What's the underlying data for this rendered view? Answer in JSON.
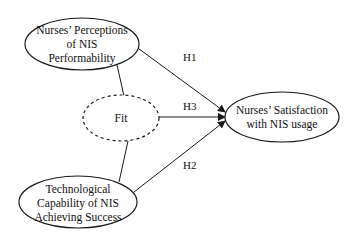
{
  "diagram": {
    "type": "research-model",
    "nodes": [
      {
        "id": "perceptions",
        "lines": [
          "Nurses’ Perceptions",
          "of NIS",
          "Performability"
        ],
        "style": "solid"
      },
      {
        "id": "fit",
        "lines": [
          "Fit"
        ],
        "style": "dashed"
      },
      {
        "id": "capability",
        "lines": [
          "Technological",
          "Capability of NIS",
          "Achieving Success"
        ],
        "style": "solid"
      },
      {
        "id": "satisfaction",
        "lines": [
          "Nurses’ Satisfaction",
          "with NIS usage"
        ],
        "style": "solid"
      }
    ],
    "edges": [
      {
        "from": "perceptions",
        "to": "satisfaction",
        "label": "H1",
        "arrow": true
      },
      {
        "from": "capability",
        "to": "satisfaction",
        "label": "H2",
        "arrow": true
      },
      {
        "from": "fit",
        "to": "satisfaction",
        "label": "H3",
        "arrow": true
      },
      {
        "from": "perceptions",
        "to": "fit",
        "label": "",
        "arrow": false
      },
      {
        "from": "fit",
        "to": "capability",
        "label": "",
        "arrow": false
      }
    ],
    "colors": {
      "stroke": "#1a1a1a",
      "background": "#ffffff"
    }
  }
}
